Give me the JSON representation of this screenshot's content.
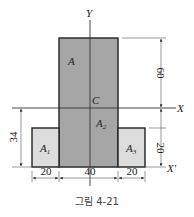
{
  "figure": {
    "caption": "그림 4-21",
    "colors": {
      "main_fill": "#a6a6a6",
      "side_fill": "#dcdcdc",
      "stroke": "#222222"
    },
    "axes": {
      "y_label": "Y",
      "x_label": "X",
      "x_prime_label": "X'",
      "centroid_label": "C"
    },
    "regions": {
      "A": "A",
      "A1": "A",
      "A1_sub": "1",
      "A2": "A",
      "A2_sub": "2",
      "A3": "A",
      "A3_sub": "3"
    },
    "dimensions": {
      "top_height": "60",
      "side_height": "20",
      "centroid_height": "34",
      "left_width": "20",
      "center_width": "40",
      "right_width": "20"
    }
  }
}
